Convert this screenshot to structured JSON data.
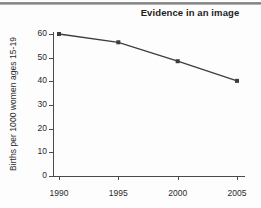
{
  "figure": {
    "title": "Evidence in an image",
    "top_rule": true,
    "background_color": "#fdfdfd",
    "line_color": "#3d3d3d",
    "axis_color": "#4a4a4a",
    "text_color": "#2a2a2a"
  },
  "chart_data": {
    "type": "line",
    "title": "Evidence in an image",
    "xlabel": "",
    "ylabel": "Births per 1000 women ages 15-19",
    "categories": [
      "1990",
      "1995",
      "2000",
      "2005"
    ],
    "x": [
      1990,
      1995,
      2000,
      2005
    ],
    "values": [
      60.0,
      56.5,
      48.5,
      40.2
    ],
    "series": [
      {
        "name": "Births per 1000 women ages 15-19",
        "values": [
          60.0,
          56.5,
          48.5,
          40.2
        ]
      }
    ],
    "xlim": [
      1990,
      2005
    ],
    "ylim": [
      0,
      60
    ],
    "ytick_labels": [
      "0",
      "10",
      "20",
      "30",
      "40",
      "50",
      "60"
    ],
    "ytick_values": [
      0,
      10,
      20,
      30,
      40,
      50,
      60
    ],
    "xtick_labels": [
      "1990",
      "1995",
      "2000",
      "2005"
    ],
    "grid": false,
    "legend": false,
    "marker": "square"
  }
}
